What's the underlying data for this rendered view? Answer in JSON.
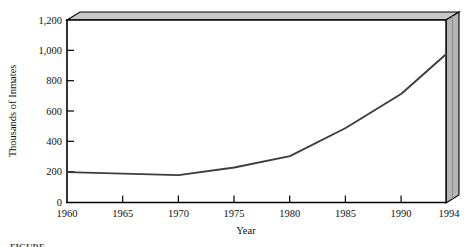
{
  "figure": {
    "name": "prison-inmate-population-line-chart",
    "caption_partial": "FIGURE"
  },
  "chart_data": {
    "type": "line",
    "title": "",
    "subtitle": "",
    "xlabel": "Year",
    "ylabel": "Thousands of Inmates",
    "x": [
      1960,
      1970,
      1975,
      1980,
      1985,
      1990,
      1994
    ],
    "values": [
      200,
      180,
      230,
      305,
      490,
      715,
      975
    ],
    "series": [
      {
        "name": "Inmates",
        "values": [
          200,
          180,
          230,
          305,
          490,
          715,
          975
        ]
      }
    ],
    "xlim": [
      1960,
      1994
    ],
    "ylim": [
      0,
      1200
    ],
    "xticks": [
      1960,
      1965,
      1970,
      1975,
      1980,
      1985,
      1990,
      1994
    ],
    "xtick_labels": [
      "1960",
      "1965",
      "1970",
      "1975",
      "1980",
      "1985",
      "1990",
      "1994"
    ],
    "yticks": [
      0,
      200,
      400,
      600,
      800,
      1000,
      1200
    ],
    "ytick_labels": [
      "0",
      "200",
      "400",
      "600",
      "800",
      "1,000",
      "1,200"
    ],
    "grid": false,
    "legend": "none",
    "line_color": "#3d3d3d",
    "plot_background": "#ffffff",
    "box_top_face_color": "#c8c8c8",
    "box_right_face_color": "#b4b4b4",
    "axis_color": "#000000"
  },
  "axis": {
    "y_title": "Thousands of Inmates",
    "x_title": "Year"
  }
}
